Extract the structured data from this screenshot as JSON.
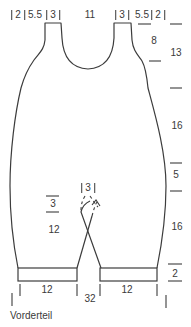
{
  "caption": "Vorderteil",
  "colors": {
    "line": "#3c3c3c",
    "text": "#3a3a3a",
    "background": "#ffffff"
  },
  "labels": {
    "top": {
      "left_edge": "2",
      "left_shoulder_slope": "5.5",
      "left_strap": "3",
      "neck_width": "11",
      "right_strap": "3",
      "right_shoulder_slope": "5.5",
      "right_edge": "2"
    },
    "right": {
      "strap": "8",
      "armhole_depth": "13",
      "body_length": "16",
      "crotch_depth": "5",
      "leg_length": "16",
      "cuff_height": "2"
    },
    "middle": {
      "crotch_bindoff": "3",
      "decrease": "3",
      "leg_length": "12"
    },
    "bottom": {
      "left_cuff_width": "12",
      "right_cuff_width": "12",
      "total_width": "32"
    }
  }
}
